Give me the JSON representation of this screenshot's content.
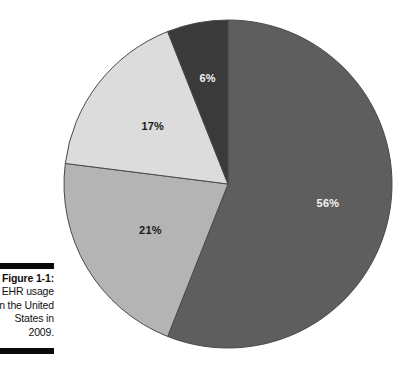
{
  "figure": {
    "caption_lines": [
      "Figure 1-1:",
      "EHR usage",
      "in the United",
      "States in",
      "2009."
    ],
    "caption_label": "Figure 1-1:",
    "rule_color": "#0a0a0a"
  },
  "chart_data": {
    "type": "pie",
    "title": "EHR usage in the United States in 2009.",
    "xlabel": "",
    "ylabel": "",
    "legend_position": "none",
    "grid": false,
    "start_angle_deg": 0,
    "direction": "clockwise",
    "categories": [
      "56%",
      "21%",
      "17%",
      "6%"
    ],
    "values": [
      56,
      21,
      17,
      6
    ],
    "labels": [
      "56%",
      "17%",
      "21%",
      "6%"
    ],
    "slices": [
      {
        "label": "56%",
        "value": 56,
        "color": "#5e5e5e",
        "label_color": "#f4f4f4",
        "label_tone": "light"
      },
      {
        "label": "21%",
        "value": 21,
        "color": "#b4b4b4",
        "label_color": "#1a1a1a",
        "label_tone": "dark"
      },
      {
        "label": "17%",
        "value": 17,
        "color": "#dcdcdc",
        "label_color": "#1a1a1a",
        "label_tone": "dark"
      },
      {
        "label": "6%",
        "value": 6,
        "color": "#3a3a3a",
        "label_color": "#f4f4f4",
        "label_tone": "light"
      }
    ],
    "total": 100,
    "stroke_color": "#4a4a4a"
  }
}
